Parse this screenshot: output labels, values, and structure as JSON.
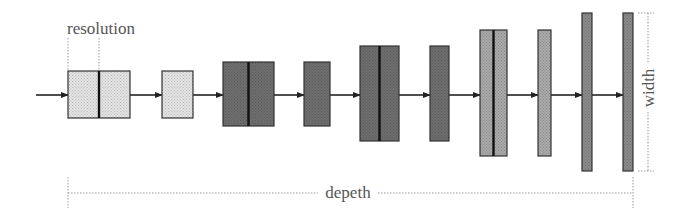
{
  "labels": {
    "resolution": "resolution",
    "depth": "depeth",
    "width": "width"
  },
  "colors": {
    "light": "#e4e4e4",
    "dark": "#6e6e6e",
    "medium": "#a9a9a9",
    "medium_dark": "#8a8a8a",
    "stroke": "#333333",
    "dim_line": "#9a9a9a"
  },
  "blocks": [
    {
      "x": 68,
      "y": 71,
      "w": 62,
      "h": 47,
      "split": true,
      "shade": "light"
    },
    {
      "x": 162,
      "y": 71,
      "w": 31,
      "h": 47,
      "split": false,
      "shade": "light"
    },
    {
      "x": 223,
      "y": 62,
      "w": 51,
      "h": 64,
      "split": true,
      "shade": "dark"
    },
    {
      "x": 304,
      "y": 62,
      "w": 26,
      "h": 64,
      "split": false,
      "shade": "dark"
    },
    {
      "x": 360,
      "y": 46,
      "w": 39,
      "h": 95,
      "split": true,
      "shade": "dark"
    },
    {
      "x": 430,
      "y": 46,
      "w": 19,
      "h": 95,
      "split": false,
      "shade": "dark"
    },
    {
      "x": 480,
      "y": 30,
      "w": 27,
      "h": 126,
      "split": true,
      "shade": "medium"
    },
    {
      "x": 538,
      "y": 30,
      "w": 13,
      "h": 126,
      "split": false,
      "shade": "medium"
    },
    {
      "x": 582,
      "y": 13,
      "w": 10,
      "h": 158,
      "split": false,
      "shade": "medium_dark"
    },
    {
      "x": 623,
      "y": 13,
      "w": 10,
      "h": 158,
      "split": false,
      "shade": "medium_dark"
    }
  ],
  "flow": {
    "arrow_y": 95,
    "input_start_x": 36
  }
}
